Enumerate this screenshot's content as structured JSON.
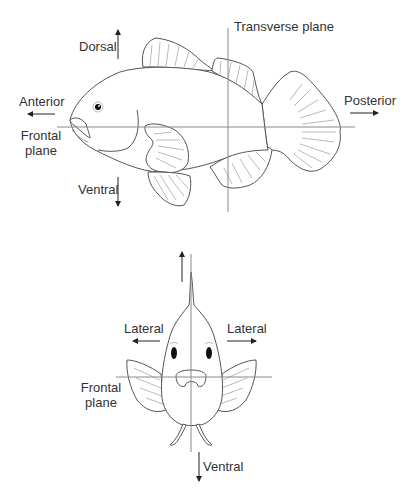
{
  "colors": {
    "outline": "#555555",
    "plane_line": "#8a8a8a",
    "fin_ray": "#a8a8a8",
    "text": "#333333",
    "arrow": "#222222"
  },
  "side_view": {
    "labels": {
      "dorsal": "Dorsal",
      "anterior": "Anterior",
      "frontal_plane_line1": "Frontal",
      "frontal_plane_line2": "plane",
      "ventral": "Ventral",
      "transverse_plane": "Transverse plane",
      "posterior": "Posterior"
    }
  },
  "front_view": {
    "labels": {
      "lateral_left": "Lateral",
      "lateral_right": "Lateral",
      "frontal_plane_line1": "Frontal",
      "frontal_plane_line2": "plane",
      "ventral": "Ventral"
    }
  }
}
